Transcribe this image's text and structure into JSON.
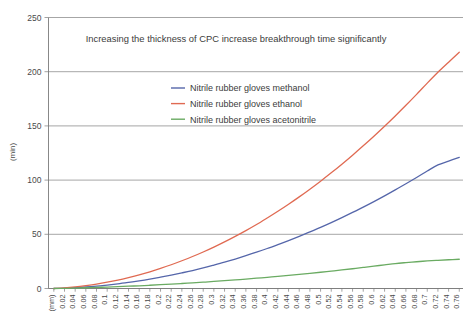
{
  "chart_data": {
    "type": "line",
    "title": "Increasing the thickness of CPC increase breakthrough time significantly",
    "xlabel": "(mm)",
    "ylabel": "(min)",
    "xlim": [
      0,
      0.78
    ],
    "ylim": [
      0,
      250
    ],
    "ytick_values": [
      0,
      50,
      100,
      150,
      200,
      250
    ],
    "ytick_labels": [
      "0",
      "50",
      "100",
      "150",
      "200",
      "250"
    ],
    "grid": "horizontal",
    "legend_position": "upper-center-left",
    "xtick_labels": [
      "(mm)",
      "0.02",
      "0.04",
      "0.06",
      "0.08",
      "0.1",
      "0.12",
      "0.14",
      "0.16",
      "0.18",
      "0.2",
      "0.22",
      "0.24",
      "0.26",
      "0.28",
      "0.3",
      "0.32",
      "0.34",
      "0.36",
      "0.38",
      "0.4",
      "0.42",
      "0.44",
      "0.46",
      "0.48",
      "0.5",
      "0.52",
      "0.54",
      "0.56",
      "0.58",
      "0.6",
      "0.62",
      "0.64",
      "0.66",
      "0.68",
      "0.7",
      "0.72",
      "0.74",
      "0.76"
    ],
    "x": [
      0.0,
      0.02,
      0.04,
      0.06,
      0.08,
      0.1,
      0.12,
      0.14,
      0.16,
      0.18,
      0.2,
      0.22,
      0.24,
      0.26,
      0.28,
      0.3,
      0.32,
      0.34,
      0.36,
      0.38,
      0.4,
      0.42,
      0.44,
      0.46,
      0.48,
      0.5,
      0.52,
      0.54,
      0.56,
      0.58,
      0.6,
      0.62,
      0.64,
      0.66,
      0.68,
      0.7,
      0.72,
      0.74,
      0.76
    ],
    "series": [
      {
        "name": "Nitrile rubber gloves methanol",
        "color": "#5566aa",
        "values": [
          0.0,
          0.3,
          0.8,
          1.4,
          2.2,
          3.2,
          4.3,
          5.6,
          7.0,
          8.6,
          10.4,
          12.3,
          14.4,
          16.6,
          19.0,
          21.6,
          24.3,
          27.2,
          30.3,
          33.5,
          36.9,
          40.5,
          44.2,
          48.1,
          52.2,
          56.4,
          60.8,
          65.4,
          70.2,
          75.1,
          80.2,
          85.5,
          91.0,
          96.6,
          102.4,
          108.4,
          114.0,
          117.5,
          121.0
        ]
      },
      {
        "name": "Nitrile rubber gloves ethanol",
        "color": "#e06a52",
        "values": [
          0.0,
          0.6,
          1.5,
          2.7,
          4.1,
          5.8,
          7.8,
          10.1,
          12.6,
          15.4,
          18.5,
          21.9,
          25.6,
          29.5,
          33.7,
          38.2,
          43.0,
          48.1,
          53.4,
          59.0,
          65.0,
          71.2,
          77.7,
          84.5,
          91.6,
          99.0,
          106.7,
          114.7,
          123.0,
          131.6,
          140.5,
          149.7,
          159.2,
          169.0,
          179.1,
          189.5,
          199.5,
          208.8,
          218.0
        ]
      },
      {
        "name": "Nitrile rubber gloves acetonitrile",
        "color": "#6aab62",
        "values": [
          0.0,
          0.2,
          0.4,
          0.7,
          1.0,
          1.3,
          1.7,
          2.1,
          2.5,
          3.0,
          3.5,
          4.0,
          4.6,
          5.2,
          5.8,
          6.5,
          7.2,
          7.9,
          8.7,
          9.5,
          10.3,
          11.2,
          12.1,
          13.0,
          14.0,
          15.0,
          16.0,
          17.1,
          18.2,
          19.4,
          20.6,
          21.8,
          23.0,
          23.9,
          24.7,
          25.4,
          26.0,
          26.5,
          27.0
        ]
      }
    ]
  },
  "legend": {
    "entries": [
      {
        "label": "Nitrile rubber gloves methanol",
        "color": "#5566aa"
      },
      {
        "label": "Nitrile rubber gloves ethanol",
        "color": "#e06a52"
      },
      {
        "label": "Nitrile rubber gloves acetonitrile",
        "color": "#6aab62"
      }
    ]
  }
}
